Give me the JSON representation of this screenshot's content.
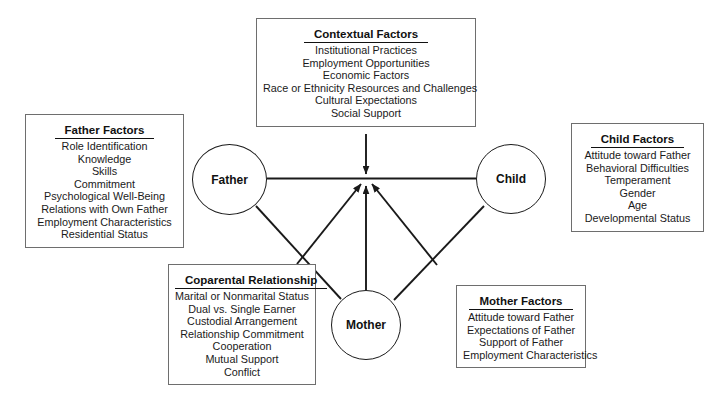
{
  "diagram": {
    "line_color": "#1a1a1a",
    "box_border_color": "#6e6e6e",
    "background": "#ffffff"
  },
  "nodes": [
    {
      "id": "father",
      "label": "Father"
    },
    {
      "id": "child",
      "label": "Child"
    },
    {
      "id": "mother",
      "label": "Mother"
    }
  ],
  "boxes": {
    "contextual": {
      "title": "Contextual Factors",
      "items": [
        "Institutional Practices",
        "Employment Opportunities",
        "Economic Factors",
        "Race or Ethnicity Resources and Challenges",
        "Cultural Expectations",
        "Social Support"
      ]
    },
    "father": {
      "title": "Father Factors",
      "items": [
        "Role Identification",
        "Knowledge",
        "Skills",
        "Commitment",
        "Psychological Well-Being",
        "Relations with Own Father",
        "Employment Characteristics",
        "Residential Status"
      ]
    },
    "child": {
      "title": "Child Factors",
      "items": [
        "Attitude toward Father",
        "Behavioral Difficulties",
        "Temperament",
        "Gender",
        "Age",
        "Developmental Status"
      ]
    },
    "coparental": {
      "title": "Coparental Relationship",
      "items": [
        "Marital or Nonmarital Status",
        "Dual vs. Single Earner",
        "Custodial Arrangement",
        "Relationship Commitment",
        "Cooperation",
        "Mutual Support",
        "Conflict"
      ]
    },
    "mother": {
      "title": "Mother Factors",
      "items": [
        "Attitude toward Father",
        "Expectations of Father",
        "Support of Father",
        "Employment Characteristics"
      ]
    }
  }
}
